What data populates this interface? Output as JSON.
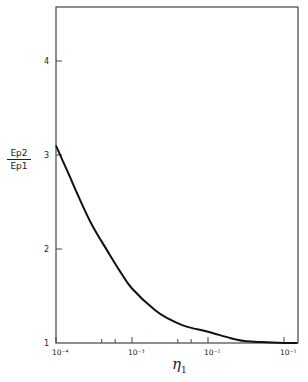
{
  "chart_data": {
    "type": "line",
    "title": "",
    "xlabel": "η1",
    "ylabel": "Ep2 / Ep1",
    "ylabel_numerator": "Ep2",
    "ylabel_denominator": "Ep1",
    "x_scale": "log",
    "xlim": [
      0.0001,
      0.15
    ],
    "ylim": [
      1,
      4.5
    ],
    "x_ticks": [
      {
        "value": 0.0001,
        "label": "10⁻⁴"
      },
      {
        "value": 0.001,
        "label": "10⁻³"
      },
      {
        "value": 0.01,
        "label": "10⁻²"
      },
      {
        "value": 0.1,
        "label": "10⁻¹"
      }
    ],
    "x_minor_ticks": [
      0.0004,
      0.0006,
      0.004,
      0.006
    ],
    "y_ticks": [
      {
        "value": 1,
        "label": "1"
      },
      {
        "value": 2,
        "label": "2"
      },
      {
        "value": 3,
        "label": "3"
      },
      {
        "value": 4,
        "label": "4"
      }
    ],
    "grid": false,
    "legend": null,
    "series": [
      {
        "name": "Ep2/Ep1",
        "x": [
          0.0001,
          0.00015,
          0.0002,
          0.0003,
          0.0005,
          0.0007,
          0.001,
          0.002,
          0.003,
          0.005,
          0.01,
          0.02,
          0.03,
          0.05,
          0.1,
          0.15
        ],
        "y": [
          3.1,
          2.78,
          2.55,
          2.25,
          1.95,
          1.76,
          1.58,
          1.35,
          1.26,
          1.18,
          1.12,
          1.05,
          1.02,
          1.01,
          1.0,
          1.0
        ]
      }
    ]
  },
  "colors": {
    "line": "#111111",
    "axis": "#333333",
    "background": "#ffffff"
  }
}
